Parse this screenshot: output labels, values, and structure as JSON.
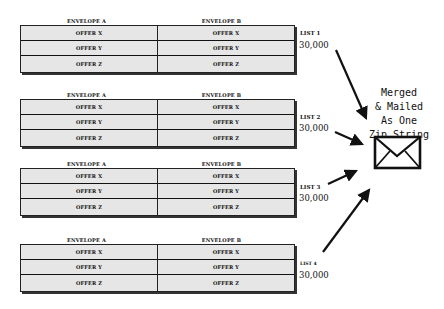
{
  "diagram": {
    "groups": [
      {
        "envelope_headers": [
          "ENVELOPE A",
          "ENVELOPE B"
        ],
        "envelope_a_rows": [
          "OFFER X",
          "OFFER Y",
          "OFFER Z"
        ],
        "envelope_b_rows": [
          "OFFER X",
          "OFFER Y",
          "OFFER Z"
        ],
        "list_label": "LIST 1",
        "list_count": "30,000"
      },
      {
        "envelope_headers": [
          "ENVELOPE A",
          "ENVELOPE B"
        ],
        "envelope_a_rows": [
          "OFFER X",
          "OFFER Y",
          "OFFER Z"
        ],
        "envelope_b_rows": [
          "OFFER X",
          "OFFER Y",
          "OFFER Z"
        ],
        "list_label": "LIST 2",
        "list_count": "30,000"
      },
      {
        "envelope_headers": [
          "ENVELOPE A",
          "ENVELOPE B"
        ],
        "envelope_a_rows": [
          "OFFER X",
          "OFFER Y",
          "OFFER Z"
        ],
        "envelope_b_rows": [
          "OFFER X",
          "OFFER Y",
          "OFFER Z"
        ],
        "list_label": "LIST 3",
        "list_count": "30,000"
      },
      {
        "envelope_headers": [
          "ENVELOPE A",
          "ENVELOPE B"
        ],
        "envelope_a_rows": [
          "OFFER X",
          "OFFER Y",
          "OFFER Z"
        ],
        "envelope_b_rows": [
          "OFFER X",
          "OFFER Y",
          "OFFER Z"
        ],
        "list_label": "LIST 4",
        "list_count": "30,000"
      }
    ],
    "merged_label_lines": [
      "Merged",
      "& Mailed",
      "As One",
      "Zip String"
    ],
    "merged_icon": "envelope-icon",
    "colors": {
      "box_fill": "#e6e6e6",
      "lines": "#111111",
      "background": "#ffffff"
    }
  }
}
